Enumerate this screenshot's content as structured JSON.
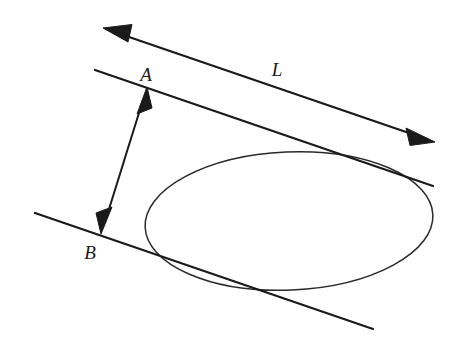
{
  "figure": {
    "background_color": "#ffffff",
    "stroke_color": "#1a1a1a",
    "width": 458,
    "height": 351,
    "labels": {
      "line_label": "L",
      "point_a": "A",
      "point_b": "B"
    },
    "label_positions": {
      "line_label": {
        "x": 277,
        "y": 76
      },
      "point_a": {
        "x": 146,
        "y": 81
      },
      "point_b": {
        "x": 83,
        "y": 259
      }
    },
    "elements": {
      "line_L": {
        "name": "L",
        "type": "double-headed-arrow",
        "x1": 103,
        "y1": 28,
        "x2": 435,
        "y2": 142,
        "arrowheads": [
          "start",
          "end"
        ]
      },
      "upper_tangent": {
        "type": "line",
        "x1": 95,
        "y1": 70,
        "x2": 433,
        "y2": 186,
        "arrowheads": []
      },
      "lower_tangent": {
        "type": "line",
        "x1": 35,
        "y1": 213,
        "x2": 373,
        "y2": 329,
        "arrowheads": []
      },
      "segment_AB": {
        "type": "double-headed-arrow",
        "x1": 147,
        "y1": 87,
        "x2": 101,
        "y2": 234,
        "arrowheads": [
          "start",
          "end"
        ]
      },
      "ellipse": {
        "type": "ellipse",
        "cx": 289,
        "cy": 221,
        "rx": 144,
        "ry": 69,
        "rotation_deg": -2.5,
        "fill": "none"
      }
    }
  }
}
